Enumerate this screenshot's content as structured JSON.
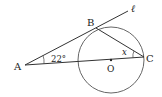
{
  "diagram": {
    "points": {
      "A": {
        "label": "A",
        "x": 25,
        "y": 65
      },
      "B": {
        "label": "B",
        "x": 96,
        "y": 28
      },
      "C": {
        "label": "C",
        "x": 144,
        "y": 57
      },
      "O": {
        "label": "O",
        "x": 111,
        "y": 60
      }
    },
    "line_label": "ℓ",
    "angle_A": "22°",
    "angle_C": "x",
    "circle": {
      "cx": 111,
      "cy": 60,
      "r": 33
    },
    "stroke_color": "#333333"
  }
}
